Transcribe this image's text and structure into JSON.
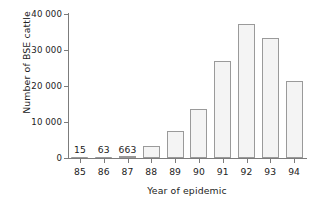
{
  "chart_data": {
    "type": "bar",
    "title": "",
    "xlabel": "Year of epidemic",
    "ylabel": "Number of BSE cattle",
    "categories": [
      "85",
      "86",
      "87",
      "88",
      "89",
      "90",
      "91",
      "92",
      "93",
      "94"
    ],
    "values": [
      15,
      63,
      663,
      3300,
      7500,
      13500,
      27000,
      37200,
      33200,
      21500
    ],
    "point_labels": [
      "15",
      "63",
      "663",
      "",
      "",
      "",
      "",
      "",
      "",
      ""
    ],
    "ylim": [
      0,
      40000
    ],
    "yticks": [
      0,
      10000,
      20000,
      30000,
      40000
    ],
    "ytick_labels": [
      "0",
      "10 000",
      "20 000",
      "30 000",
      "40 000"
    ],
    "grid": false,
    "legend": null,
    "bar_fill_color": "#f4f4f4",
    "bar_border_color": "#9a9a9a",
    "axis_color": "#7c7c7c",
    "text_color": "#222222"
  }
}
